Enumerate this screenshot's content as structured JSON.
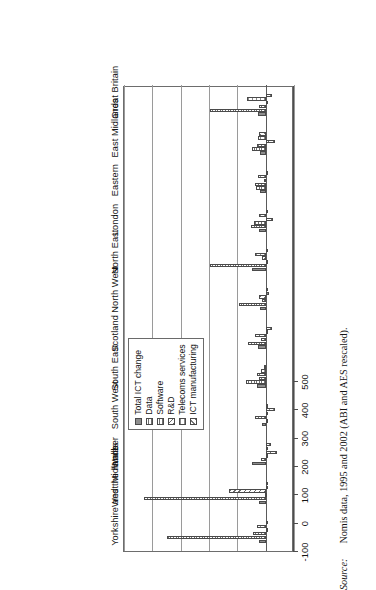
{
  "chart_data": {
    "type": "bar",
    "orientation": "vertical-rotated",
    "title": "",
    "xlabel": "",
    "ylabel": "",
    "ylim": [
      -100,
      500
    ],
    "yticks": [
      -100,
      0,
      100,
      200,
      300,
      400,
      500
    ],
    "ytick_labels": [
      "-100",
      "0",
      "100",
      "200",
      "300",
      "400",
      "500"
    ],
    "grid": true,
    "legend_position": "upper-right",
    "categories": [
      "Yorkshire and the Humber",
      "West Midlands",
      "Wales",
      "South West",
      "South East",
      "Scotland",
      "North West",
      "North East",
      "London",
      "Eastern",
      "East Midlands",
      "Great Britain"
    ],
    "series": [
      {
        "name": "Total ICT change",
        "pattern": "solid-grey",
        "values": [
          22,
          25,
          47,
          14,
          32,
          28,
          21,
          48,
          25,
          20,
          21,
          26
        ]
      },
      {
        "name": "Data",
        "pattern": "horizontal-lines",
        "values": [
          350,
          430,
          17,
          0,
          68,
          62,
          93,
          196,
          53,
          33,
          49,
          196
        ]
      },
      {
        "name": "Software",
        "pattern": "fine-grid",
        "values": [
          45,
          2,
          -2,
          37,
          23,
          15,
          14,
          -3,
          42,
          38,
          29,
          24
        ]
      },
      {
        "name": "R&D",
        "pattern": "diagonal-hatch",
        "values": [
          -3,
          131,
          -40,
          -1,
          30,
          36,
          25,
          12,
          -25,
          5,
          -32,
          -10
        ]
      },
      {
        "name": "Telecoms services",
        "pattern": "coarse-grid",
        "values": [
          30,
          -2,
          -6,
          -32,
          17,
          -7,
          -13,
          36,
          23,
          26,
          27,
          67
        ]
      },
      {
        "name": "ICT manufacturing",
        "pattern": "back-diagonal-hatch",
        "values": [
          -2,
          -3,
          -18,
          -5,
          6,
          -24,
          -7,
          -6,
          -3,
          -4,
          22,
          -22
        ]
      }
    ]
  },
  "legend": {
    "items": [
      "Total ICT change",
      "Data",
      "Software",
      "R&D",
      "Telecoms services",
      "ICT manufacturing"
    ]
  },
  "source": {
    "label": "Source:",
    "text": "Nomis data, 1995 and 2002 (ABI and AES rescaled)."
  }
}
